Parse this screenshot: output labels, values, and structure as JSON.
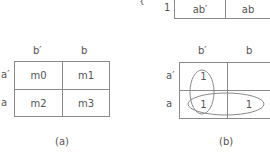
{
  "top_fragment": {
    "brace_glyph": "{",
    "row_label": "1",
    "cells": [
      "ab′",
      "ab"
    ]
  },
  "map_a": {
    "col_headers": [
      "b′",
      "b"
    ],
    "row_headers": [
      "a′",
      "a"
    ],
    "cells": [
      [
        "m0",
        "m1"
      ],
      [
        "m2",
        "m3"
      ]
    ],
    "caption": "(a)"
  },
  "map_b": {
    "col_headers": [
      "b′",
      "b"
    ],
    "row_headers": [
      "a′",
      "a"
    ],
    "cells": [
      [
        "1",
        ""
      ],
      [
        "1",
        "1"
      ]
    ],
    "groupings": [
      {
        "name": "column-b-prime-group",
        "cells": [
          "r0c0",
          "r1c0"
        ],
        "orientation": "vertical"
      },
      {
        "name": "row-a-group",
        "cells": [
          "r1c0",
          "r1c1"
        ],
        "orientation": "horizontal"
      }
    ],
    "caption": "(b)"
  },
  "colors": {
    "line": "#8a8a8a",
    "text": "#555555",
    "background": "#ffffff"
  }
}
